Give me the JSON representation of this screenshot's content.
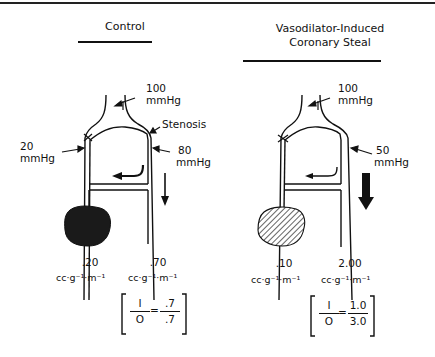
{
  "panels": [
    {
      "id": "control",
      "title_lines": [
        "Control"
      ],
      "labels": {
        "aortic_pressure_value": "100",
        "aortic_pressure_unit": "mmHg",
        "stenosis": "Stenosis",
        "collateral_pressure_value": "20",
        "collateral_pressure_unit": "mmHg",
        "distal_pressure_value": "80",
        "distal_pressure_unit": "mmHg"
      },
      "flows": {
        "collateral_bed_flow": ".20",
        "normal_bed_flow": ".70",
        "flow_unit": "cc·g⁻¹·m⁻¹"
      },
      "ratio": {
        "numerator_symbol": "I",
        "denominator_symbol": "O",
        "equals": "=",
        "numerator_value": ".7",
        "denominator_value": ".7"
      },
      "region_fill": "solid",
      "flow_arrow_size": "thin"
    },
    {
      "id": "vasodilator",
      "title_lines": [
        "Vasodilator-Induced",
        "Coronary Steal"
      ],
      "labels": {
        "aortic_pressure_value": "100",
        "aortic_pressure_unit": "mmHg",
        "distal_pressure_value": "50",
        "distal_pressure_unit": "mmHg"
      },
      "flows": {
        "collateral_bed_flow": ".10",
        "normal_bed_flow": "2.00",
        "flow_unit": "cc·g⁻¹·m⁻¹"
      },
      "ratio": {
        "numerator_symbol": "I",
        "denominator_symbol": "O",
        "equals": "=",
        "numerator_value": "1.0",
        "denominator_value": "3.0"
      },
      "region_fill": "hatched",
      "flow_arrow_size": "thick"
    }
  ],
  "colors": {
    "ink": "#111111",
    "background": "#ffffff",
    "ischemic_region_solid": "#1a1a1a"
  }
}
